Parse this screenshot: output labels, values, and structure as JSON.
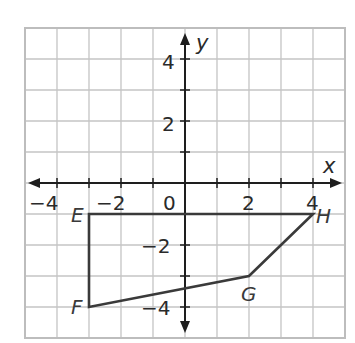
{
  "diagram": {
    "type": "coordinate-plane",
    "x_range": [
      -5,
      5
    ],
    "y_range": [
      -5,
      5
    ],
    "axes": {
      "x_label": "x",
      "y_label": "y"
    },
    "x_tick_labels": [
      {
        "value": -4,
        "text": "−4"
      },
      {
        "value": -2,
        "text": "−2"
      },
      {
        "value": 0,
        "text": "0"
      },
      {
        "value": 2,
        "text": "2"
      },
      {
        "value": 4,
        "text": "4"
      }
    ],
    "y_tick_labels": [
      {
        "value": 4,
        "text": "4"
      },
      {
        "value": 2,
        "text": "2"
      },
      {
        "value": -2,
        "text": "−2"
      },
      {
        "value": -4,
        "text": "−4"
      }
    ],
    "polygon": {
      "name": "EFGH",
      "vertices": [
        {
          "label": "E",
          "x": -3,
          "y": -1
        },
        {
          "label": "F",
          "x": -3,
          "y": -4
        },
        {
          "label": "G",
          "x": 2,
          "y": -3
        },
        {
          "label": "H",
          "x": 4,
          "y": -1
        }
      ]
    },
    "colors": {
      "grid": "#c4c4c4",
      "axis": "#1e1e1e",
      "polygon": "#3a3a3a",
      "background": "#ffffff"
    }
  }
}
